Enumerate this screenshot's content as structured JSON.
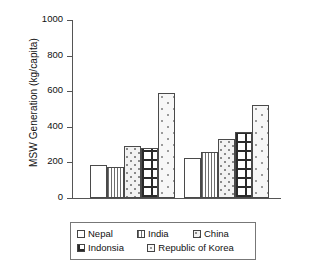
{
  "chart_data": {
    "type": "bar",
    "title": "",
    "xlabel": "",
    "ylabel": "MSW Generation (kg/capita)",
    "categories": [
      "1995",
      "2025"
    ],
    "ylim": [
      0,
      1000
    ],
    "yticks": [
      "0",
      "200",
      "400",
      "600",
      "800",
      "1000"
    ],
    "grid": false,
    "legend_position": "bottom",
    "series": [
      {
        "name": "Nepal",
        "values": [
          185,
          225
        ]
      },
      {
        "name": "India",
        "values": [
          175,
          260
        ]
      },
      {
        "name": "China",
        "values": [
          290,
          330
        ]
      },
      {
        "name": "Indonsia",
        "values": [
          280,
          372
        ]
      },
      {
        "name": "Republic of Korea",
        "values": [
          590,
          525
        ]
      }
    ]
  },
  "legend": {
    "row1": [
      "Nepal",
      "India",
      "China"
    ],
    "row2": [
      "Indonsia",
      "Republic of Korea"
    ]
  },
  "colors": {
    "axis": "#555555",
    "bar_outline": "#4a4a4a",
    "text": "#111111",
    "background": "#ffffff"
  }
}
